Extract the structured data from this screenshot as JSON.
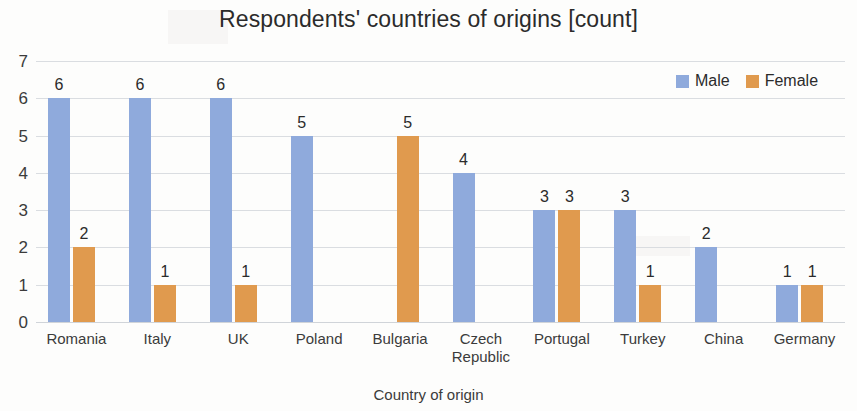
{
  "chart_data": {
    "type": "bar",
    "title": "Respondents' countries of origins [count]",
    "xlabel": "Country of origin",
    "ylabel": "",
    "ylim": [
      0,
      7
    ],
    "ytick_values": [
      0,
      1,
      2,
      3,
      4,
      5,
      6,
      7
    ],
    "grid": true,
    "legend_position": "top-right",
    "categories": [
      "Romania",
      "Italy",
      "UK",
      "Poland",
      "Bulgaria",
      "Czech Republic",
      "Portugal",
      "Turkey",
      "China",
      "Germany"
    ],
    "series": [
      {
        "name": "Male",
        "color": "#8faadc",
        "values": [
          6,
          6,
          6,
          5,
          0,
          4,
          3,
          3,
          2,
          1
        ]
      },
      {
        "name": "Female",
        "color": "#e09a4e",
        "values": [
          2,
          1,
          1,
          0,
          5,
          0,
          3,
          1,
          0,
          1
        ]
      }
    ]
  },
  "legend": {
    "items": [
      {
        "label": "Male",
        "color": "#8faadc"
      },
      {
        "label": "Female",
        "color": "#e09a4e"
      }
    ]
  }
}
